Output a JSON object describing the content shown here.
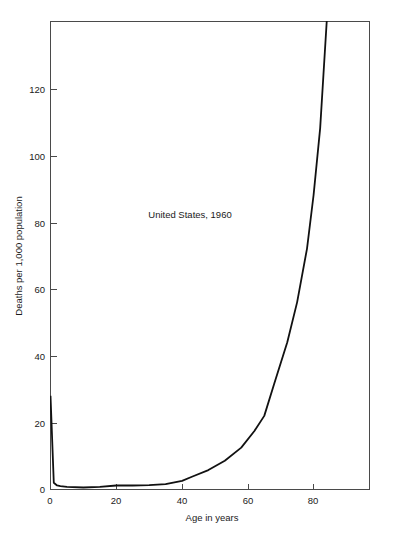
{
  "chart_data": {
    "type": "line",
    "title": "",
    "annotation": "United States, 1960",
    "xlabel": "Age in years",
    "ylabel": "Deaths per 1,000 population",
    "xlim": [
      0,
      97
    ],
    "ylim": [
      0,
      140
    ],
    "xticks": [
      0,
      20,
      40,
      60,
      80
    ],
    "xtick_labels": [
      "0",
      "20",
      "40",
      "60",
      "80"
    ],
    "yticks": [
      0,
      20,
      40,
      60,
      80,
      100,
      120
    ],
    "ytick_labels": [
      "0",
      "20",
      "40",
      "60",
      "80",
      "100",
      "120"
    ],
    "grid": false,
    "legend": null,
    "series": [
      {
        "name": "Age-specific death rate",
        "x": [
          0,
          1,
          2,
          3,
          5,
          10,
          15,
          20,
          25,
          30,
          35,
          40,
          43,
          48,
          53,
          58,
          62,
          65,
          68,
          72,
          75,
          78,
          80,
          82,
          83,
          84
        ],
        "values": [
          28.0,
          2.0,
          1.2,
          1.0,
          0.8,
          0.6,
          0.8,
          1.2,
          1.2,
          1.3,
          1.6,
          2.6,
          3.8,
          5.8,
          8.6,
          12.5,
          17.5,
          22.0,
          31.5,
          44.0,
          56.0,
          72.0,
          88.0,
          108.0,
          124.0,
          140.0
        ]
      }
    ]
  },
  "axes": {
    "x_title": "Age in years",
    "y_title": "Deaths per 1,000 population"
  },
  "annotations": {
    "region_year": "United States, 1960"
  },
  "colors": {
    "line": "#111111",
    "frame": "#4a4a4a",
    "background": "#ffffff",
    "text": "#1a1a1a"
  }
}
